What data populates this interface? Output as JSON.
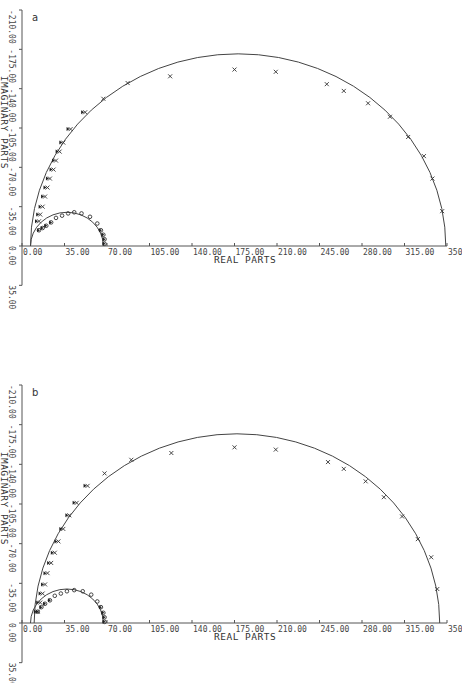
{
  "panels": [
    {
      "id": "a",
      "label": "a",
      "xlabel": "REAL PARTS",
      "ylabel": "IMAGINARY PARTS",
      "x_ticks": [
        "0.00",
        "35.00",
        "70.00",
        "105.00",
        "140.00",
        "175.00",
        "210.00",
        "245.00",
        "280.00",
        "315.00",
        "350"
      ],
      "y_ticks": [
        "-210.00",
        "-175.00",
        "-140.00",
        "-105.00",
        "-70.00",
        "-35.00",
        "0.00",
        "35.00"
      ]
    },
    {
      "id": "b",
      "label": "b",
      "xlabel": "REAL PARTS",
      "ylabel": "IMAGINARY PARTS",
      "x_ticks": [
        "0.00",
        "35.00",
        "70.00",
        "105.00",
        "140.00",
        "175.00",
        "210.00",
        "245.00",
        "280.00",
        "315.00",
        "350"
      ],
      "y_ticks": [
        "-210.00",
        "-175.00",
        "-140.00",
        "-105.00",
        "-70.00",
        "-35.00",
        "0.00",
        "35.00"
      ]
    }
  ],
  "chart_data": [
    {
      "type": "scatter",
      "title": "a",
      "xlabel": "REAL PARTS",
      "ylabel": "IMAGINARY PARTS",
      "xlim": [
        0,
        350
      ],
      "ylim": [
        -210,
        35
      ],
      "grid": false,
      "y_inverted_note": "negative imaginary plotted upward",
      "fitted_curves": [
        {
          "name": "large semicircle fit",
          "center_real": 178,
          "center_imag": 0,
          "radius": 171
        },
        {
          "name": "small semicircle fit",
          "center_real": 37,
          "center_imag": 0,
          "radius": 30
        }
      ],
      "series": [
        {
          "name": "large arc data (x markers)",
          "marker": "x",
          "points": [
            [
              14,
              -22
            ],
            [
              15,
              -28
            ],
            [
              17,
              -35
            ],
            [
              19,
              -44
            ],
            [
              21,
              -52
            ],
            [
              23,
              -60
            ],
            [
              26,
              -68
            ],
            [
              28,
              -76
            ],
            [
              31,
              -84
            ],
            [
              34,
              -92
            ],
            [
              40,
              -104
            ],
            [
              52,
              -119
            ],
            [
              67,
              -131
            ],
            [
              87,
              -145
            ],
            [
              122,
              -151
            ],
            [
              175,
              -157
            ],
            [
              209,
              -155
            ],
            [
              251,
              -144
            ],
            [
              265,
              -138
            ],
            [
              285,
              -127
            ],
            [
              303,
              -115
            ],
            [
              318,
              -97
            ],
            [
              331,
              -80
            ],
            [
              338,
              -60
            ],
            [
              346,
              -31
            ]
          ]
        },
        {
          "name": "small arc data (triangle/o markers)",
          "marker": "o",
          "points": [
            [
              14,
              -14
            ],
            [
              17,
              -16
            ],
            [
              20,
              -18
            ],
            [
              24,
              -21
            ],
            [
              28,
              -25
            ],
            [
              33,
              -27
            ],
            [
              38,
              -29
            ],
            [
              43,
              -30
            ],
            [
              49,
              -29
            ],
            [
              56,
              -26
            ],
            [
              62,
              -20
            ],
            [
              65,
              -14
            ],
            [
              67,
              -10
            ],
            [
              68,
              -6
            ],
            [
              68,
              -2
            ]
          ]
        }
      ]
    },
    {
      "type": "scatter",
      "title": "b",
      "xlabel": "REAL PARTS",
      "ylabel": "IMAGINARY PARTS",
      "xlim": [
        0,
        350
      ],
      "ylim": [
        -210,
        35
      ],
      "grid": false,
      "fitted_curves": [
        {
          "name": "large semicircle fit",
          "center_real": 177,
          "center_imag": 0,
          "radius": 167
        },
        {
          "name": "small semicircle fit",
          "center_real": 37,
          "center_imag": 0,
          "radius": 30
        }
      ],
      "series": [
        {
          "name": "large arc data (x markers)",
          "marker": "x",
          "points": [
            [
              13,
              -10
            ],
            [
              15,
              -18
            ],
            [
              17,
              -26
            ],
            [
              19,
              -34
            ],
            [
              21,
              -44
            ],
            [
              24,
              -53
            ],
            [
              27,
              -62
            ],
            [
              30,
              -72
            ],
            [
              34,
              -83
            ],
            [
              39,
              -95
            ],
            [
              45,
              -106
            ],
            [
              54,
              -121
            ],
            [
              68,
              -132
            ],
            [
              90,
              -144
            ],
            [
              123,
              -150
            ],
            [
              175,
              -155
            ],
            [
              209,
              -153
            ],
            [
              252,
              -142
            ],
            [
              265,
              -136
            ],
            [
              283,
              -125
            ],
            [
              298,
              -111
            ],
            [
              313,
              -94
            ],
            [
              326,
              -74
            ],
            [
              337,
              -58
            ],
            [
              342,
              -30
            ]
          ]
        },
        {
          "name": "small arc data (triangle/o markers)",
          "marker": "o",
          "points": [
            [
              13,
              -10
            ],
            [
              16,
              -14
            ],
            [
              19,
              -17
            ],
            [
              23,
              -20
            ],
            [
              27,
              -24
            ],
            [
              32,
              -26
            ],
            [
              37,
              -28
            ],
            [
              43,
              -29
            ],
            [
              50,
              -28
            ],
            [
              57,
              -25
            ],
            [
              62,
              -19
            ],
            [
              65,
              -14
            ],
            [
              67,
              -9
            ],
            [
              68,
              -5
            ],
            [
              68,
              -1
            ]
          ]
        }
      ]
    }
  ]
}
